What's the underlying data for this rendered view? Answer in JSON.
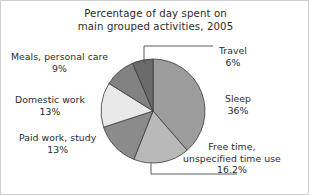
{
  "chart_data": {
    "type": "pie",
    "title": "Percentage of day spent on main grouped activities, 2005",
    "title_line1": "Percentage of day spent on",
    "title_line2": "main grouped activities, 2005",
    "xlabel": "",
    "ylabel": "",
    "legend": "none",
    "grid": false,
    "categories": [
      "Sleep",
      "Free time, unspecified time use",
      "Paid work, study",
      "Domestic work",
      "Meals, personal care",
      "Travel"
    ],
    "values": [
      36,
      16.2,
      13,
      13,
      9,
      6
    ],
    "value_labels": [
      "36%",
      "16.2%",
      "13%",
      "13%",
      "9%",
      "6%"
    ],
    "colors": [
      "#9c9c9c",
      "#b9b9b9",
      "#8b8b8b",
      "#e9e9e9",
      "#828282",
      "#6b6b6b"
    ],
    "slices": [
      {
        "name": "Sleep",
        "label_line1": "Sleep",
        "label_line2": "36%",
        "value": 36,
        "value_label": "36%",
        "color": "#9c9c9c"
      },
      {
        "name": "Free time, unspecified time use",
        "label_line1": "Free time,",
        "label_line2": "unspecified time use",
        "label_line3": "16.2%",
        "value": 16.2,
        "value_label": "16.2%",
        "color": "#b9b9b9"
      },
      {
        "name": "Paid work, study",
        "label_line1": "Paid work, study",
        "label_line2": "13%",
        "value": 13,
        "value_label": "13%",
        "color": "#8b8b8b"
      },
      {
        "name": "Domestic work",
        "label_line1": "Domestic work",
        "label_line2": "13%",
        "value": 13,
        "value_label": "13%",
        "color": "#e9e9e9"
      },
      {
        "name": "Meals, personal care",
        "label_line1": "Meals, personal care",
        "label_line2": "9%",
        "value": 9,
        "value_label": "9%",
        "color": "#828282"
      },
      {
        "name": "Travel",
        "label_line1": "Travel",
        "label_line2": "6%",
        "value": 6,
        "value_label": "6%",
        "color": "#6b6b6b"
      }
    ],
    "geometry": {
      "center_x": 152,
      "center_y": 110,
      "radius": 52,
      "start_angle_deg": 0,
      "stroke": "#3a3a3a",
      "stroke_width": 0.8
    },
    "leaders": [
      {
        "name": "travel-leader",
        "points": "143,62 143,45 212,45"
      },
      {
        "name": "freetime-leader",
        "points": "150,162 150,173 236,173"
      }
    ]
  }
}
